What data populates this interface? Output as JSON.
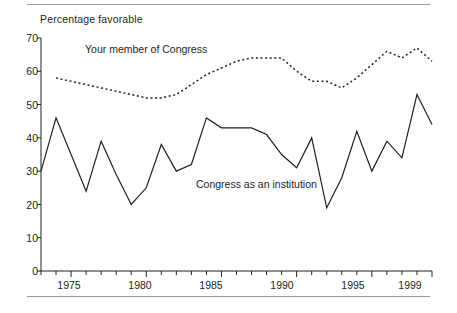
{
  "chart_data": {
    "type": "line",
    "title": "",
    "ylabel": "Percentage favorable",
    "xlabel": "",
    "ylim": [
      0,
      70
    ],
    "xlim": [
      1973,
      1999
    ],
    "ytick_step": 10,
    "yticks": [
      0,
      10,
      20,
      30,
      40,
      50,
      60,
      70
    ],
    "ytick_labels": [
      "0",
      "10",
      "20",
      "30",
      "40",
      "50",
      "60",
      "70"
    ],
    "xticks_labeled": [
      1975,
      1980,
      1985,
      1990,
      1995,
      1999
    ],
    "xtick_labels": [
      "1975",
      "1980",
      "1985",
      "1990",
      "1995",
      "1999"
    ],
    "xtick_minor_step": 1,
    "grid": false,
    "legend": "inline-annotations",
    "series": [
      {
        "name": "Your member of Congress",
        "style": "dotted",
        "color": "#231f20",
        "x": [
          1974,
          1975,
          1976,
          1977,
          1978,
          1979,
          1980,
          1981,
          1982,
          1983,
          1984,
          1985,
          1986,
          1987,
          1988,
          1989,
          1990,
          1991,
          1992,
          1993,
          1994,
          1995,
          1996,
          1997,
          1998,
          1999
        ],
        "values": [
          58,
          57,
          56,
          55,
          54,
          53,
          52,
          52,
          53,
          56,
          59,
          61,
          63,
          64,
          64,
          64,
          60,
          57,
          57,
          55,
          58,
          62,
          66,
          64,
          67,
          63
        ]
      },
      {
        "name": "Congress as an institution",
        "style": "solid",
        "color": "#231f20",
        "x": [
          1973,
          1974,
          1975,
          1976,
          1977,
          1978,
          1979,
          1980,
          1981,
          1982,
          1983,
          1984,
          1985,
          1986,
          1987,
          1988,
          1989,
          1990,
          1991,
          1992,
          1993,
          1994,
          1995,
          1996,
          1997,
          1998,
          1999
        ],
        "values": [
          30,
          46,
          35,
          24,
          39,
          29,
          20,
          25,
          38,
          30,
          32,
          46,
          43,
          43,
          43,
          41,
          35,
          31,
          40,
          19,
          28,
          42,
          30,
          39,
          34,
          53,
          44
        ]
      }
    ]
  },
  "annotations": {
    "your_member": "Your member of Congress",
    "institution": "Congress as an institution"
  }
}
